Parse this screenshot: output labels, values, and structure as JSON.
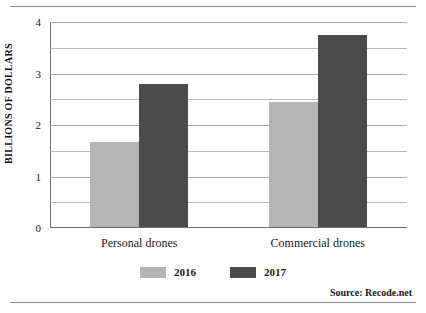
{
  "figure": {
    "source_note": "Source:  Recode.net"
  },
  "chart_data": {
    "type": "bar",
    "title": "",
    "xlabel": "",
    "ylabel": "BILLIONS OF DOLLARS",
    "categories": [
      "Personal drones",
      "Commercial drones"
    ],
    "series": [
      {
        "name": "2016",
        "color": "#b4b4b4",
        "values": [
          1.65,
          2.43
        ]
      },
      {
        "name": "2017",
        "color": "#4b4b4b",
        "values": [
          2.78,
          3.72
        ]
      }
    ],
    "ylim": [
      0,
      4
    ],
    "ytick_labels": [
      "0",
      "1",
      "2",
      "3",
      "4"
    ],
    "ytick_values": [
      0,
      1,
      2,
      3,
      4
    ],
    "minor_gridline_values": [
      0.5,
      1.5,
      2.5,
      3.5
    ],
    "grid": true,
    "legend_position": "bottom-center",
    "legend_entries": [
      "2016",
      "2017"
    ]
  }
}
